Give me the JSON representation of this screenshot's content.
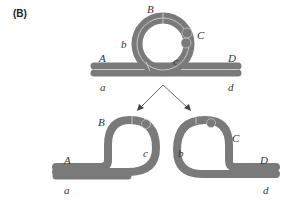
{
  "panel_label": "(B)",
  "colors": {
    "chromatid": "#7a7a7a",
    "chromatid_seam": "#d8d8d8",
    "arrow": "#444444",
    "text": "#333333"
  },
  "top_figure": {
    "description": "Paired homologous chromatids with a loop (inversion loop) containing segments b, B, C, c",
    "labels": {
      "B": "B",
      "b": "b",
      "C": "C",
      "c": "c",
      "A": "A",
      "D": "D",
      "a": "a",
      "d": "d"
    }
  },
  "bottom_left": {
    "labels": {
      "B": "B",
      "c": "c",
      "A": "A",
      "a": "a"
    }
  },
  "bottom_right": {
    "labels": {
      "C": "C",
      "b": "b",
      "D": "D",
      "d": "d"
    }
  }
}
